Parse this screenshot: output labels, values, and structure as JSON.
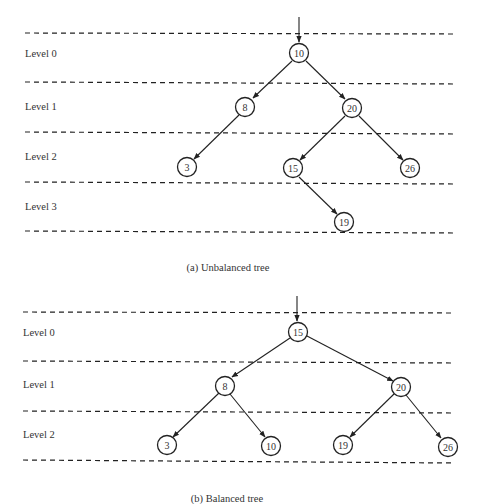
{
  "figures": [
    {
      "id": "a",
      "caption": "(a) Unbalanced tree",
      "levels": [
        "Level 0",
        "Level 1",
        "Level 2",
        "Level 3"
      ],
      "nodes": [
        {
          "value": "10",
          "level": 0
        },
        {
          "value": "8",
          "level": 1
        },
        {
          "value": "20",
          "level": 1
        },
        {
          "value": "3",
          "level": 2
        },
        {
          "value": "15",
          "level": 2
        },
        {
          "value": "26",
          "level": 2
        },
        {
          "value": "19",
          "level": 3
        }
      ],
      "edges": [
        [
          "10",
          "8"
        ],
        [
          "10",
          "20"
        ],
        [
          "8",
          "3"
        ],
        [
          "20",
          "15"
        ],
        [
          "20",
          "26"
        ],
        [
          "15",
          "19"
        ]
      ]
    },
    {
      "id": "b",
      "caption": "(b) Balanced tree",
      "levels": [
        "Level 0",
        "Level 1",
        "Level 2"
      ],
      "nodes": [
        {
          "value": "15",
          "level": 0
        },
        {
          "value": "8",
          "level": 1
        },
        {
          "value": "20",
          "level": 1
        },
        {
          "value": "3",
          "level": 2
        },
        {
          "value": "10",
          "level": 2
        },
        {
          "value": "19",
          "level": 2
        },
        {
          "value": "26",
          "level": 2
        }
      ],
      "edges": [
        [
          "15",
          "8"
        ],
        [
          "15",
          "20"
        ],
        [
          "8",
          "3"
        ],
        [
          "8",
          "10"
        ],
        [
          "20",
          "19"
        ],
        [
          "20",
          "26"
        ]
      ]
    }
  ]
}
